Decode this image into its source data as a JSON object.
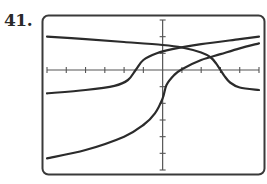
{
  "problem": {
    "number_label": "41."
  },
  "chart_data": {
    "type": "line",
    "title": "",
    "xlabel": "",
    "ylabel": "",
    "xlim": [
      -6,
      5
    ],
    "ylim": [
      -6,
      3
    ],
    "x_tick_step": 1,
    "y_tick_step": 1,
    "grid": false,
    "legend": "none",
    "colors": {
      "curve": "#2b2b2b",
      "axis": "#555555",
      "frame": "#3a3a3a"
    },
    "series": [
      {
        "name": "curve-1-decreasing",
        "description": "decreasing curve with vertical inflection on x-axis near x=3",
        "points": [
          [
            -6,
            2.0
          ],
          [
            -4,
            1.85
          ],
          [
            -2,
            1.68
          ],
          [
            0,
            1.5
          ],
          [
            1,
            1.35
          ],
          [
            2,
            1.05
          ],
          [
            2.5,
            0.75
          ],
          [
            2.8,
            0.35
          ],
          [
            3,
            0.0
          ],
          [
            3.2,
            -0.35
          ],
          [
            3.5,
            -0.75
          ],
          [
            4,
            -1.05
          ],
          [
            5,
            -1.2
          ]
        ]
      },
      {
        "name": "curve-2-increasing-shifted",
        "description": "increasing curve with vertical inflection on x-axis near x=-1.4",
        "points": [
          [
            -6,
            -1.4
          ],
          [
            -4,
            -1.2
          ],
          [
            -2.5,
            -0.95
          ],
          [
            -1.8,
            -0.6
          ],
          [
            -1.4,
            0.0
          ],
          [
            -1.0,
            0.6
          ],
          [
            -0.3,
            1.0
          ],
          [
            0.5,
            1.25
          ],
          [
            2,
            1.55
          ],
          [
            4,
            1.85
          ],
          [
            5,
            2.0
          ]
        ]
      },
      {
        "name": "curve-3-increasing-origin",
        "description": "cube-root-like curve with vertical inflection on y-axis near y=-1.7",
        "points": [
          [
            -6,
            -5.3
          ],
          [
            -4,
            -4.8
          ],
          [
            -2,
            -4.0
          ],
          [
            -1,
            -3.3
          ],
          [
            -0.4,
            -2.6
          ],
          [
            0,
            -1.7
          ],
          [
            0.2,
            -0.9
          ],
          [
            0.6,
            -0.3
          ],
          [
            1,
            0.05
          ],
          [
            2,
            0.6
          ],
          [
            3,
            0.95
          ],
          [
            4,
            1.3
          ],
          [
            5,
            1.6
          ]
        ]
      }
    ]
  }
}
